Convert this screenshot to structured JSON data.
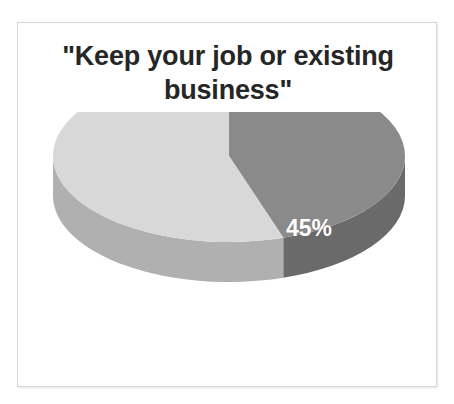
{
  "figure": {
    "title": "\"Keep your job or existing business\"",
    "title_line_1": "\"Keep your job or existing",
    "title_line_2": "business\"",
    "border_color": "#d5d5d5",
    "background_color": "#ffffff"
  },
  "chart_data": {
    "type": "pie",
    "title": "\"Keep your job or existing business\"",
    "subtitle": "",
    "xlabel": "",
    "ylabel": "",
    "style": "3d",
    "legend": false,
    "legend_position": "none",
    "grid": false,
    "start_angle_deg": 0,
    "direction": "clockwise",
    "labels": [
      "45%",
      ""
    ],
    "categories": [
      "Keep your job or existing business",
      "Other"
    ],
    "values": [
      45,
      55
    ],
    "value_unit": "%",
    "visible_data_labels": [
      "45%"
    ],
    "colors": [
      "#8a8a8a",
      "#d8d8d8"
    ],
    "side_colors": [
      "#6a6a6a",
      "#b0b0b0"
    ],
    "slices": [
      {
        "label": "45%",
        "value": 45,
        "top_color": "#8a8a8a",
        "side_color": "#6a6a6a",
        "label_color": "#ffffff",
        "label_x": 291,
        "label_y": 116
      },
      {
        "label": "",
        "value": 55,
        "top_color": "#d8d8d8",
        "side_color": "#b0b0b0",
        "label_color": "#ffffff",
        "label_x": 0,
        "label_y": 0
      }
    ]
  }
}
